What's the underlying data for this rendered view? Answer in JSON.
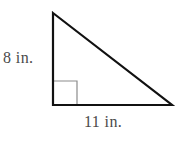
{
  "figure": {
    "kind": "right-triangle",
    "stroke_color": "#111111",
    "stroke_width": 2.2,
    "right_angle_marker_color": "#8c8c8c",
    "right_angle_marker_width": 1.2,
    "background_color": "#ffffff",
    "label_color": "#4a4a4a",
    "vertices": {
      "apex": {
        "x": 53,
        "y": 13
      },
      "bottom_left": {
        "x": 53,
        "y": 105
      },
      "bottom_right": {
        "x": 172,
        "y": 105
      }
    },
    "right_angle_marker": {
      "size": 24,
      "x": 53,
      "y": 105
    }
  },
  "labels": {
    "vertical_leg": "8 in.",
    "horizontal_leg": "11 in."
  },
  "measurements": {
    "vertical_leg_value": 8,
    "horizontal_leg_value": 11,
    "unit": "in."
  }
}
